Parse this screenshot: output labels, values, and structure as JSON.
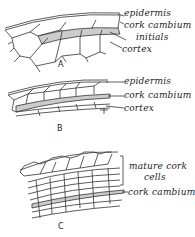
{
  "figure": {
    "panels": [
      {
        "id": "A",
        "labels": [
          "epidermis",
          "cork cambium",
          "initials",
          "cortex"
        ]
      },
      {
        "id": "B",
        "labels": [
          "epidermis",
          "cork cambium",
          "cortex"
        ]
      },
      {
        "id": "C",
        "labels": [
          "mature cork",
          "cells",
          "cork cambium"
        ]
      }
    ]
  }
}
